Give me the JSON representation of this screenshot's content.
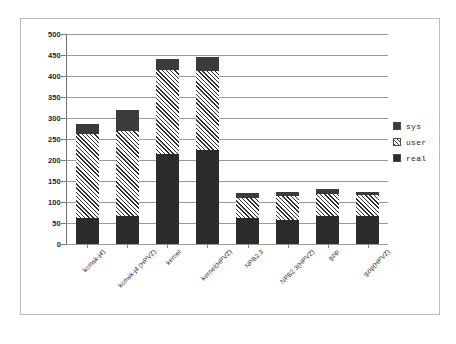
{
  "chart_data": {
    "type": "bar",
    "stacked": true,
    "title": "",
    "xlabel": "",
    "ylabel": "",
    "ylim": [
      0,
      500
    ],
    "ytick_step": 50,
    "yticks": [
      "500",
      "450",
      "400",
      "350",
      "300",
      "250",
      "200",
      "150",
      "100",
      "50",
      "0"
    ],
    "grid": true,
    "legend_position": "right",
    "categories": [
      "kcmsk-j4)",
      "kcmsk-j4 (HPVZ)",
      "kernel",
      "kernel(HPVZ)",
      "NPB2.3",
      "NPB2.3(HPVZ)",
      "gzip",
      "gzip(HPVZ)"
    ],
    "series": [
      {
        "name": "real",
        "values": [
          62,
          66,
          214,
          224,
          61,
          57,
          66,
          66
        ]
      },
      {
        "name": "user",
        "values": [
          200,
          203,
          200,
          188,
          49,
          58,
          54,
          50
        ]
      },
      {
        "name": "sys",
        "values": [
          23,
          51,
          27,
          33,
          11,
          10,
          11,
          9
        ]
      }
    ],
    "totals": [
      285,
      320,
      441,
      445,
      121,
      125,
      131,
      125
    ],
    "colors": {
      "sys": "#3b3b3b",
      "user": "#cfcfcf",
      "real": "#2b2b2b",
      "gridline": "#9a9a9a",
      "axis": "#6f6f6f",
      "border": "#b9b9b9",
      "background": "#ffffff",
      "text": "#2a2626"
    }
  },
  "legend": {
    "items": [
      {
        "label": "sys",
        "swatch": "sys-swatch-icon"
      },
      {
        "label": "user",
        "swatch": "user-swatch-icon"
      },
      {
        "label": "real",
        "swatch": "real-swatch-icon"
      }
    ]
  }
}
